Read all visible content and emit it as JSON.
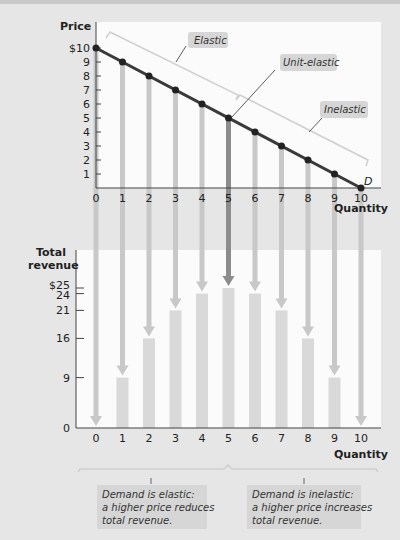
{
  "chart_data": [
    {
      "type": "line",
      "title": "",
      "xlabel": "Quantity",
      "ylabel": "Price",
      "x": [
        0,
        1,
        2,
        3,
        4,
        5,
        6,
        7,
        8,
        9,
        10
      ],
      "values": [
        10,
        9,
        8,
        7,
        6,
        5,
        4,
        3,
        2,
        1,
        0
      ],
      "x_ticks": [
        "0",
        "1",
        "2",
        "3",
        "4",
        "5",
        "6",
        "7",
        "8",
        "9",
        "10"
      ],
      "y_ticks": [
        "$10",
        "9",
        "8",
        "7",
        "6",
        "5",
        "4",
        "3",
        "2",
        "1"
      ],
      "ylim": [
        0,
        10
      ],
      "xlim": [
        0,
        10
      ],
      "curve_label": "D",
      "annotations": [
        "Elastic",
        "Unit-elastic",
        "Inelastic"
      ]
    },
    {
      "type": "bar",
      "title": "",
      "xlabel": "Quantity",
      "ylabel": "Total revenue",
      "categories": [
        "0",
        "1",
        "2",
        "3",
        "4",
        "5",
        "6",
        "7",
        "8",
        "9",
        "10"
      ],
      "values": [
        0,
        9,
        16,
        21,
        24,
        25,
        24,
        21,
        16,
        9,
        0
      ],
      "y_ticks": [
        "0",
        "9",
        "16",
        "21",
        "24",
        "$25"
      ],
      "ylim": [
        0,
        25
      ],
      "annotations": [
        "Demand is elastic: a higher price reduces total revenue.",
        "Demand is inelastic: a higher price increases total revenue."
      ]
    }
  ],
  "top": {
    "ylabel": "Price",
    "xlabel": "Quantity",
    "curve_label": "D",
    "y_ticks": [
      "$10",
      "9",
      "8",
      "7",
      "6",
      "5",
      "4",
      "3",
      "2",
      "1"
    ],
    "x_ticks": [
      "0",
      "1",
      "2",
      "3",
      "4",
      "5",
      "6",
      "7",
      "8",
      "9",
      "10"
    ],
    "elastic": "Elastic",
    "unit": "Unit-elastic",
    "inelastic": "Inelastic"
  },
  "bottom": {
    "ylabel1": "Total",
    "ylabel2": "revenue",
    "xlabel": "Quantity",
    "zero": "0",
    "x_ticks": [
      "0",
      "1",
      "2",
      "3",
      "4",
      "5",
      "6",
      "7",
      "8",
      "9",
      "10"
    ],
    "note_left": [
      "Demand is elastic:",
      "a higher price reduces",
      "total revenue."
    ],
    "note_right": [
      "Demand is inelastic:",
      "a higher price increases",
      "total revenue."
    ]
  },
  "colors": {
    "line": "#3a3a3a",
    "bar": "#d9d9d9",
    "arrow": "#c8c8c8",
    "arrow_unit": "#8c8c8c",
    "callout": "#d6d6d6"
  }
}
